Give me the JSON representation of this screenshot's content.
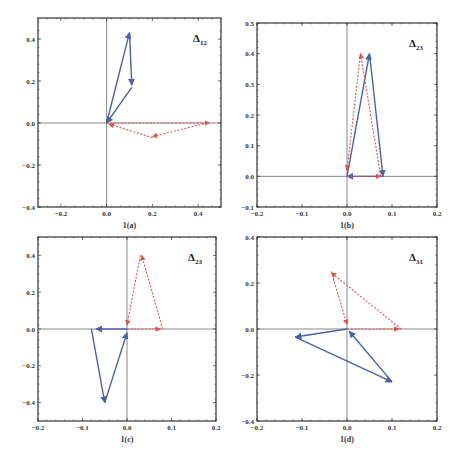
{
  "colors": {
    "blue": "#4a62a8",
    "red": "#e0534a",
    "frame": "#333333",
    "axis": "#555555"
  },
  "chart_data": [
    {
      "type": "line",
      "subtype": "vector-triangle",
      "panel": "1(a)",
      "title": "Δ12",
      "title_main": "Δ",
      "title_sub": "12",
      "xlabel": "1(a)",
      "xlim": [
        -0.3,
        0.5
      ],
      "ylim": [
        -0.4,
        0.5
      ],
      "xticks": [
        "-0.2",
        "0.0",
        "0.2",
        "0.4"
      ],
      "xtick_values": [
        -0.2,
        0.0,
        0.2,
        0.4
      ],
      "yticks": [
        "-0.4",
        "-0.2",
        "0.0",
        "0.2",
        "0.4"
      ],
      "ytick_values": [
        -0.4,
        -0.2,
        0.0,
        0.2,
        0.4
      ],
      "frame": {
        "x0": 38,
        "x1": 221,
        "y0": 18,
        "y1": 207
      },
      "series": [
        {
          "name": "blue-solid",
          "style": "solid",
          "color": "#4a62a8",
          "points": [
            [
              0,
              0
            ],
            [
              0.1,
              0.43
            ],
            [
              0.11,
              0.17
            ],
            [
              0,
              0
            ]
          ],
          "arrows": [
            [
              [
                0,
                0
              ],
              [
                0.1,
                0.43
              ]
            ],
            [
              [
                0.1,
                0.43
              ],
              [
                0.11,
                0.18
              ]
            ],
            [
              [
                0.11,
                0.17
              ],
              [
                0.0,
                0.0
              ]
            ]
          ]
        },
        {
          "name": "red-dashed",
          "style": "dashed",
          "color": "#e0534a",
          "points": [
            [
              0,
              0
            ],
            [
              0.44,
              0
            ],
            [
              0.2,
              -0.07
            ],
            [
              0.02,
              -0.01
            ]
          ],
          "arrows": [
            [
              [
                0,
                0
              ],
              [
                0.45,
                0
              ]
            ],
            [
              [
                0.44,
                0
              ],
              [
                0.2,
                -0.065
              ]
            ],
            [
              [
                0.2,
                -0.07
              ],
              [
                0.01,
                -0.005
              ]
            ]
          ]
        }
      ]
    },
    {
      "type": "line",
      "subtype": "vector-triangle",
      "panel": "1(b)",
      "title": "Δ23",
      "title_main": "Δ",
      "title_sub": "23",
      "xlabel": "1(b)",
      "xlim": [
        -0.2,
        0.2
      ],
      "ylim": [
        -0.1,
        0.5
      ],
      "xticks": [
        "-0.2",
        "-0.1",
        "0.0",
        "0.1",
        "0.2"
      ],
      "xtick_values": [
        -0.2,
        -0.1,
        0.0,
        0.1,
        0.2
      ],
      "yticks": [
        "-0.1",
        "0.0",
        "0.1",
        "0.2",
        "0.3",
        "0.4",
        "0.5"
      ],
      "ytick_values": [
        -0.1,
        0.0,
        0.1,
        0.2,
        0.3,
        0.4,
        0.5
      ],
      "frame": {
        "x0": 257,
        "x1": 437,
        "y0": 23,
        "y1": 207
      },
      "series": [
        {
          "name": "blue-solid",
          "style": "solid",
          "color": "#4a62a8",
          "points": [
            [
              0,
              0
            ],
            [
              0.05,
              0.4
            ],
            [
              0.08,
              0
            ],
            [
              0,
              0
            ]
          ],
          "arrows": [
            [
              [
                0,
                0
              ],
              [
                0.05,
                0.4
              ]
            ],
            [
              [
                0.05,
                0.4
              ],
              [
                0.08,
                0.0
              ]
            ],
            [
              [
                0.08,
                0
              ],
              [
                0.0,
                0.0
              ]
            ]
          ]
        },
        {
          "name": "red-dashed",
          "style": "dashed",
          "color": "#e0534a",
          "points": [
            [
              0,
              0
            ],
            [
              0.075,
              0
            ],
            [
              0.03,
              0.4
            ],
            [
              0.0,
              0.02
            ]
          ],
          "arrows": [
            [
              [
                0,
                0
              ],
              [
                0.075,
                0
              ]
            ],
            [
              [
                0.075,
                0
              ],
              [
                0.03,
                0.4
              ]
            ],
            [
              [
                0.03,
                0.4
              ],
              [
                0.0,
                0.02
              ]
            ]
          ]
        }
      ]
    },
    {
      "type": "line",
      "subtype": "vector-triangle",
      "panel": "1(c)",
      "title": "Δ23",
      "title_main": "Δ",
      "title_sub": "23",
      "xlabel": "1(c)",
      "xlim": [
        -0.2,
        0.2
      ],
      "ylim": [
        -0.5,
        0.5
      ],
      "xticks": [
        "-0.2",
        "-0.1",
        "0.0",
        "0.1",
        "0.2"
      ],
      "xtick_values": [
        -0.2,
        -0.1,
        0.0,
        0.1,
        0.2
      ],
      "yticks": [
        "-0.4",
        "-0.2",
        "0.0",
        "0.2",
        "0.4"
      ],
      "ytick_values": [
        -0.4,
        -0.2,
        0.0,
        0.2,
        0.4
      ],
      "frame": {
        "x0": 38,
        "x1": 216,
        "y0": 237,
        "y1": 421
      },
      "series": [
        {
          "name": "red-dashed",
          "style": "dashed",
          "color": "#e0534a",
          "points": [
            [
              0,
              0
            ],
            [
              0.08,
              0
            ],
            [
              0.03,
              0.4
            ],
            [
              0.0,
              0.02
            ]
          ],
          "arrows": [
            [
              [
                0,
                0
              ],
              [
                0.075,
                0
              ]
            ],
            [
              [
                0.08,
                0
              ],
              [
                0.033,
                0.4
              ]
            ],
            [
              [
                0.03,
                0.4
              ],
              [
                0.0,
                0.02
              ]
            ]
          ]
        },
        {
          "name": "blue-solid",
          "style": "solid",
          "color": "#4a62a8",
          "points": [
            [
              0,
              0
            ],
            [
              -0.08,
              0
            ],
            [
              -0.05,
              -0.4
            ],
            [
              0,
              -0.02
            ]
          ],
          "arrows": [
            [
              [
                0,
                0
              ],
              [
                -0.07,
                0
              ]
            ],
            [
              [
                -0.08,
                0
              ],
              [
                -0.05,
                -0.4
              ]
            ],
            [
              [
                -0.05,
                -0.4
              ],
              [
                0.0,
                -0.02
              ]
            ]
          ]
        }
      ]
    },
    {
      "type": "line",
      "subtype": "vector-triangle",
      "panel": "1(d)",
      "title": "Δ31",
      "title_main": "Δ",
      "title_sub": "31",
      "xlabel": "1(d)",
      "xlim": [
        -0.2,
        0.2
      ],
      "ylim": [
        -0.4,
        0.4
      ],
      "xticks": [
        "-0.2",
        "-0.1",
        "0.0",
        "0.1",
        "0.2"
      ],
      "xtick_values": [
        -0.2,
        -0.1,
        0.0,
        0.1,
        0.2
      ],
      "yticks": [
        "-0.4",
        "-0.2",
        "0.0",
        "0.2",
        "0.4"
      ],
      "ytick_values": [
        -0.4,
        -0.2,
        0.0,
        0.2,
        0.4
      ],
      "frame": {
        "x0": 257,
        "x1": 437,
        "y0": 237,
        "y1": 421
      },
      "series": [
        {
          "name": "red-dashed",
          "style": "dashed",
          "color": "#e0534a",
          "points": [
            [
              0,
              0
            ],
            [
              0.12,
              0
            ],
            [
              -0.035,
              0.25
            ],
            [
              0.0,
              0.02
            ]
          ],
          "arrows": [
            [
              [
                0,
                0
              ],
              [
                0.115,
                0
              ]
            ],
            [
              [
                0.12,
                0
              ],
              [
                -0.035,
                0.245
              ]
            ],
            [
              [
                -0.035,
                0.25
              ],
              [
                0.0,
                0.02
              ]
            ]
          ]
        },
        {
          "name": "blue-solid",
          "style": "solid",
          "color": "#4a62a8",
          "points": [
            [
              0,
              0
            ],
            [
              -0.115,
              -0.035
            ],
            [
              0.1,
              -0.23
            ],
            [
              0,
              0
            ]
          ],
          "arrows": [
            [
              [
                0,
                0
              ],
              [
                -0.115,
                -0.035
              ]
            ],
            [
              [
                -0.115,
                -0.035
              ],
              [
                0.1,
                -0.23
              ]
            ],
            [
              [
                0.1,
                -0.23
              ],
              [
                0.005,
                -0.01
              ]
            ]
          ]
        }
      ]
    }
  ]
}
